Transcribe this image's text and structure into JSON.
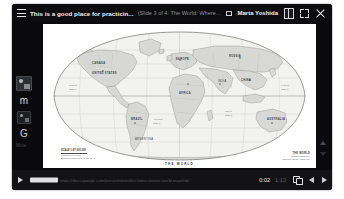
{
  "window": {
    "app": "presentation-viewer"
  },
  "topbar": {
    "menu_icon": "hamburger-icon",
    "doc_title": "This is a good place for practicin...",
    "slide_meta": "(Slide 3 of 4: The World: Where is you...",
    "present_icon": "presenting-badge-icon",
    "user_name": "Marta Yoshida",
    "book_icon": "book-icon",
    "expand_icon": "expand-icon",
    "close_icon": "close-icon"
  },
  "rail": {
    "items": [
      {
        "name": "app-thumbnail",
        "label": ""
      },
      {
        "name": "mail-app",
        "label": "m"
      },
      {
        "name": "app-thumbnail-2",
        "label": ""
      },
      {
        "name": "google-app",
        "label": "G"
      }
    ],
    "caption": "Mute"
  },
  "slide": {
    "caption": "THE WORLD",
    "scale": {
      "title": "SCALE 1:87,000,000",
      "lines": [
        "Robinson Projection",
        "Standard parallels 38° N and 38° S"
      ]
    },
    "legend": {
      "title": "THE WORLD",
      "lines": [
        "National boundary",
        "National capital  •  Major city"
      ]
    }
  },
  "player": {
    "play_icon": "play-icon",
    "seek_label": "https://docs.google.com/presentation/d/e/slides-viewer-world-map/edit",
    "current_time": "0:02",
    "total_time": "1:13",
    "copy_icon": "copy-icon",
    "prev_icon": "nav-left-icon",
    "next_icon": "nav-right-icon"
  },
  "colors": {
    "frame": "#0b0b0d",
    "topbar": "#0c0c0e",
    "playerbar": "#131316",
    "text_primary": "#f2f2f4",
    "text_muted": "#8f8f96",
    "slide_bg": "#ffffff"
  }
}
